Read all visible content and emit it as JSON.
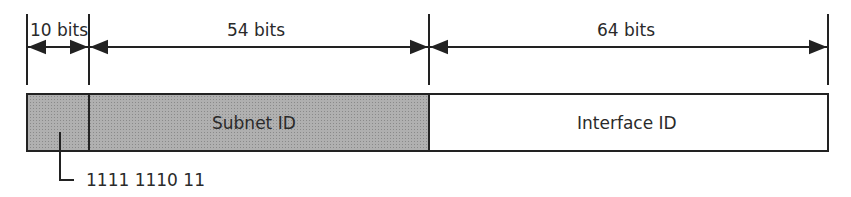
{
  "diagram": {
    "fields": [
      {
        "name": "prefix",
        "width_label": "10 bits",
        "value_label": "1111 1110 11",
        "fill": "#a8a8a8"
      },
      {
        "name": "subnet",
        "width_label": "54 bits",
        "label": "Subnet ID",
        "fill": "#a8a8a8"
      },
      {
        "name": "interface",
        "width_label": "64 bits",
        "label": "Interface ID",
        "fill": "#ffffff"
      }
    ]
  }
}
